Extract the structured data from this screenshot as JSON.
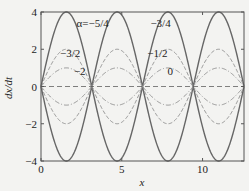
{
  "chart_data": {
    "type": "line",
    "title": "",
    "xlabel": "x",
    "ylabel": "dx/dt",
    "xlim": [
      0,
      12.566
    ],
    "ylim": [
      -4,
      4
    ],
    "xticks": [
      0,
      5,
      10
    ],
    "xtick_labels": [
      "0",
      "5",
      "10"
    ],
    "yticks": [
      -4,
      -2,
      0,
      2,
      4
    ],
    "ytick_labels": [
      "−4",
      "−2",
      "0",
      "2",
      "4"
    ],
    "grid": false,
    "legend": "inline annotations",
    "function_form": "dx/dt = ±A·|sin(x)|",
    "series": [
      {
        "name": "±4 (solid)",
        "amplitude": 4,
        "style": "solid",
        "color": "#666666",
        "width": 1.4
      },
      {
        "name": "±2 (dashed)",
        "amplitude": 2,
        "style": "dashed",
        "color": "#8a8a8a",
        "width": 0.9
      },
      {
        "name": "±1 (dash-dot)",
        "amplitude": 1,
        "style": "dashdot",
        "color": "#8a8a8a",
        "width": 0.9
      },
      {
        "name": "zero (dashed)",
        "amplitude": 0,
        "style": "longdash",
        "color": "#555555",
        "width": 1.0
      }
    ],
    "annotations": [
      {
        "text": "α=−5/4",
        "x": 3.2,
        "y": 3.2
      },
      {
        "text": "−3/4",
        "x": 7.4,
        "y": 3.2
      },
      {
        "text": "−3/2",
        "x": 1.8,
        "y": 1.6
      },
      {
        "text": "−1/2",
        "x": 7.2,
        "y": 1.6
      },
      {
        "text": "−2",
        "x": 2.4,
        "y": 0.6
      },
      {
        "text": "0",
        "x": 8.0,
        "y": 0.6
      }
    ]
  }
}
